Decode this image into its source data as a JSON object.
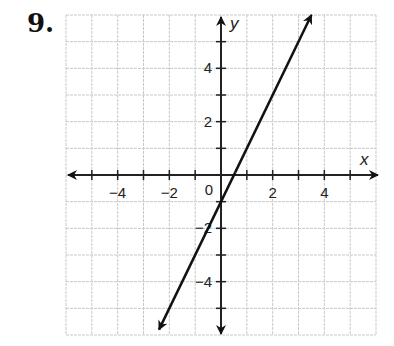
{
  "problem": {
    "number": "9."
  },
  "chart_data": {
    "type": "line",
    "title": "",
    "xlabel": "x",
    "ylabel": "y",
    "xlim": [
      -6,
      6
    ],
    "ylim": [
      -6,
      6
    ],
    "grid": true,
    "grid_step": 1,
    "x_tick_labels": [
      {
        "value": -4,
        "label": "−4"
      },
      {
        "value": -2,
        "label": "−2"
      },
      {
        "value": 2,
        "label": "2"
      },
      {
        "value": 4,
        "label": "4"
      }
    ],
    "y_tick_labels": [
      {
        "value": 4,
        "label": "4"
      },
      {
        "value": 2,
        "label": "2"
      },
      {
        "value": -2,
        "label": "−2"
      },
      {
        "value": -4,
        "label": "−4"
      }
    ],
    "origin_label": "0",
    "series": [
      {
        "name": "line",
        "equation": "y = 2x - 1",
        "slope": 2,
        "y_intercept": -1,
        "x_intercept": 0.5,
        "x": [
          -2.4,
          0,
          0.5,
          3.5
        ],
        "y": [
          -5.8,
          -1,
          0,
          6
        ],
        "arrows_both_ends": true,
        "color": "#111111"
      }
    ]
  },
  "colors": {
    "grid": "#c8c8c8",
    "axis": "#222222",
    "line": "#111111"
  }
}
